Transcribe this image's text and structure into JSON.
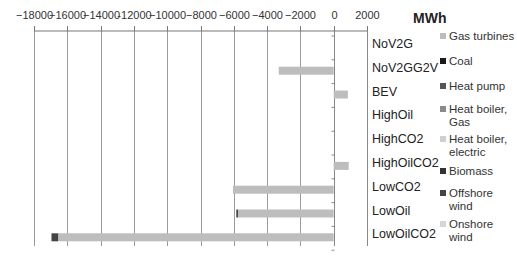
{
  "chart_data": {
    "type": "bar",
    "orientation": "horizontal",
    "stacked": true,
    "title": "",
    "unit_label": "MWh",
    "xlabel": "MWh",
    "ylabel": "",
    "xlim": [
      -18000,
      2000
    ],
    "x_ticks": [
      -18000,
      -16000,
      -14000,
      -12000,
      -10000,
      -8000,
      -6000,
      -4000,
      -2000,
      0,
      2000
    ],
    "x_tick_labels": [
      "−18000",
      "−16000",
      "−14000",
      "-12000",
      "−10000",
      "−8000",
      "−6000",
      "−4000",
      "−2000",
      "0",
      "2000"
    ],
    "x_axis_position": "top",
    "grid": true,
    "legend_position": "right",
    "categories": [
      "NoV2G",
      "NoV2GG2V",
      "BEV",
      "HighOil",
      "HighCO2",
      "HighOilCO2",
      "LowCO2",
      "LowOil",
      "LowOilCO2"
    ],
    "series": [
      {
        "name": "Gas turbines",
        "color": "#bdbdbd",
        "values": [
          0,
          -3300,
          850,
          0,
          0,
          900,
          -6050,
          -5750,
          -16550
        ]
      },
      {
        "name": "Coal",
        "color": "#1a1a1a",
        "values": [
          0,
          0,
          0,
          0,
          0,
          0,
          0,
          0,
          0
        ]
      },
      {
        "name": "Heat pump",
        "color": "#555555",
        "values": [
          0,
          0,
          0,
          0,
          0,
          0,
          0,
          0,
          0
        ]
      },
      {
        "name": "Heat boiler, Gas",
        "color": "#8a8a8a",
        "values": [
          0,
          0,
          0,
          0,
          0,
          0,
          0,
          0,
          0
        ]
      },
      {
        "name": "Heat boiler, electric",
        "color": "#cfcfcf",
        "values": [
          0,
          0,
          0,
          0,
          0,
          0,
          0,
          0,
          0
        ]
      },
      {
        "name": "Biomass",
        "color": "#333333",
        "values": [
          0,
          0,
          0,
          0,
          0,
          0,
          0,
          0,
          0
        ]
      },
      {
        "name": "Offshore wind",
        "color": "#444444",
        "values": [
          0,
          0,
          0,
          0,
          0,
          0,
          0,
          -100,
          -400
        ]
      },
      {
        "name": "Onshore wind",
        "color": "#d6d6d6",
        "values": [
          0,
          0,
          0,
          0,
          0,
          0,
          0,
          0,
          0
        ]
      }
    ]
  },
  "legend": {
    "items": [
      {
        "lines": [
          "Gas turbines"
        ],
        "color": "#bdbdbd"
      },
      {
        "lines": [
          "Coal"
        ],
        "color": "#1a1a1a"
      },
      {
        "lines": [
          "Heat pump"
        ],
        "color": "#555555"
      },
      {
        "lines": [
          "Heat boiler,",
          "Gas"
        ],
        "color": "#8a8a8a"
      },
      {
        "lines": [
          "Heat boiler,",
          "electric"
        ],
        "color": "#cfcfcf"
      },
      {
        "lines": [
          "Biomass"
        ],
        "color": "#333333"
      },
      {
        "lines": [
          "Offshore",
          "wind"
        ],
        "color": "#444444"
      },
      {
        "lines": [
          "Onshore",
          "wind"
        ],
        "color": "#d6d6d6"
      }
    ]
  }
}
